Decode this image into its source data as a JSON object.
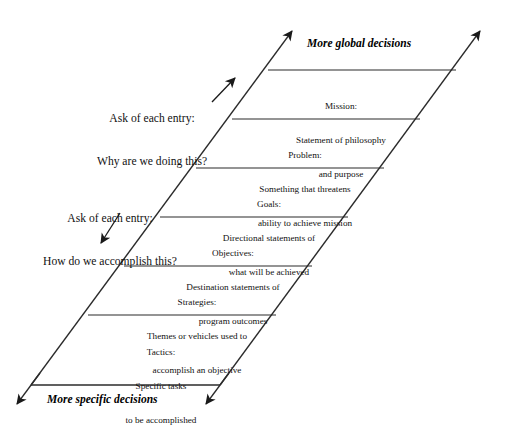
{
  "diagram": {
    "axis_labels": {
      "top": "More global decisions",
      "bottom": "More specific decisions"
    },
    "annotations": [
      {
        "line1": "Ask of each entry:",
        "line2": "Why are we doing this?",
        "arrow": "arrow-up-right"
      },
      {
        "line1": "Ask of each entry:",
        "line2": "How do we accomplish this?",
        "arrow": "arrow-down-left"
      }
    ],
    "bands": [
      {
        "heading": "Mission:",
        "line2": "Statement of philosophy",
        "line3": "and purpose"
      },
      {
        "heading": "Problem:",
        "line2": "Something that threatens",
        "line3": "ability to achieve mission"
      },
      {
        "heading": "Goals:",
        "line2": "Directional statements of",
        "line3": "what will be achieved"
      },
      {
        "heading": "Objectives:",
        "line2": "Destination statements of",
        "line3": "program outcomes"
      },
      {
        "heading": "Strategies:",
        "line2": "Themes or vehicles used to",
        "line3": "accomplish an objective"
      },
      {
        "heading": "Tactics:",
        "line2": "Specific tasks",
        "line3": "to be accomplished"
      }
    ],
    "colors": {
      "ink": "#1a1a1a",
      "line": "#2b2b2b",
      "background": "#ffffff"
    }
  }
}
